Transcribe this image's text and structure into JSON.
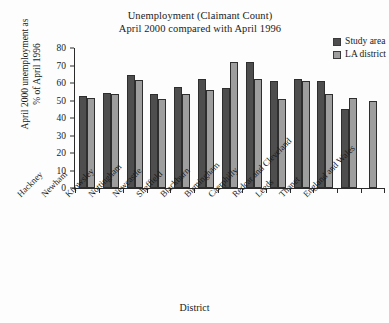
{
  "chart_data": {
    "type": "bar",
    "title": "Unemployment (Claimant Count) April 2000 compared with April 1996",
    "title_lines": [
      "Unemployment (Claimant Count)",
      "April 2000 compared with April 1996"
    ],
    "xlabel": "District",
    "ylabel": "April 2000 unemployment as % of April 1996",
    "ylabel_lines": [
      "April 2000 unemployment as",
      "% of April 1996"
    ],
    "ylim": [
      0,
      80
    ],
    "yticks": [
      0,
      10,
      20,
      30,
      40,
      50,
      60,
      70,
      80
    ],
    "ytick_labels": [
      "0",
      "10",
      "20",
      "30",
      "40",
      "50",
      "60",
      "70",
      "80"
    ],
    "grid": false,
    "legend_position": "top-right",
    "categories": [
      "Hackney",
      "Newham",
      "Knowsley",
      "Nottingham",
      "Newcastle",
      "Sheffield",
      "Blackburn",
      "Birmingham",
      "Caerphilly",
      "Redcar and Cleveland",
      "Leeds",
      "Thanet",
      "England and Wales"
    ],
    "series": [
      {
        "name": "Study area",
        "color": "#4e4e4e",
        "values": [
          52.5,
          54.5,
          64.5,
          53.5,
          58,
          62.5,
          57,
          72,
          61,
          62.5,
          61,
          45,
          null
        ]
      },
      {
        "name": "LA district",
        "color": "#9e9e9e",
        "values": [
          51.5,
          53.5,
          62,
          51,
          53.5,
          56,
          72,
          62.5,
          51,
          61,
          53.5,
          51.5,
          50
        ]
      }
    ]
  },
  "legend": {
    "items": [
      {
        "label": "Study area",
        "color": "#4e4e4e"
      },
      {
        "label": "LA district",
        "color": "#9e9e9e"
      }
    ]
  }
}
